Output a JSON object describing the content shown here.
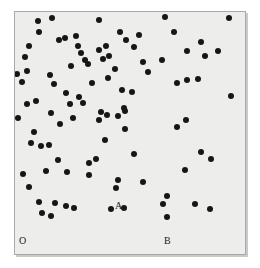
{
  "figure": {
    "type": "scatter",
    "title": "",
    "background_color": "#ffffff",
    "plot_background_color": "#ededeb",
    "border_color": "#a9a9a9",
    "point_color": "#161616",
    "label_color": "#1a1a1a",
    "point_diameter_px": 6,
    "frame": {
      "left": 14,
      "top": 11,
      "width": 232,
      "height": 244
    }
  },
  "labels": {
    "origin": "O",
    "origin_pos": {
      "x": 4,
      "y": 224
    },
    "point_labels": [
      {
        "text": "A",
        "x": 100,
        "y": 189
      },
      {
        "text": "B",
        "x": 149,
        "y": 224
      }
    ]
  },
  "chart_data": {
    "type": "scatter",
    "title": "",
    "xlabel": "",
    "ylabel": "",
    "xlim": [
      0,
      232
    ],
    "ylim": [
      0,
      244
    ],
    "grid": false,
    "legend": null,
    "annotations": [
      {
        "label": "O",
        "x": 4,
        "y": 229,
        "role": "origin-marker"
      },
      {
        "label": "A",
        "x": 104,
        "y": 194,
        "role": "named-point"
      },
      {
        "label": "B",
        "x": 152,
        "y": 229,
        "role": "named-point"
      }
    ],
    "point_count": 96,
    "points": [
      [
        23,
        9
      ],
      [
        37,
        6
      ],
      [
        84,
        8
      ],
      [
        150,
        5
      ],
      [
        214,
        6
      ],
      [
        24,
        20
      ],
      [
        50,
        26
      ],
      [
        61,
        24
      ],
      [
        105,
        20
      ],
      [
        124,
        23
      ],
      [
        159,
        20
      ],
      [
        186,
        30
      ],
      [
        14,
        34
      ],
      [
        44,
        28
      ],
      [
        63,
        34
      ],
      [
        84,
        38
      ],
      [
        91,
        34
      ],
      [
        111,
        28
      ],
      [
        119,
        35
      ],
      [
        10,
        45
      ],
      [
        66,
        41
      ],
      [
        70,
        48
      ],
      [
        94,
        44
      ],
      [
        172,
        39
      ],
      [
        190,
        44
      ],
      [
        2,
        62
      ],
      [
        7,
        70
      ],
      [
        12,
        59
      ],
      [
        56,
        54
      ],
      [
        73,
        52
      ],
      [
        88,
        47
      ],
      [
        100,
        57
      ],
      [
        128,
        50
      ],
      [
        133,
        60
      ],
      [
        147,
        48
      ],
      [
        203,
        39
      ],
      [
        216,
        84
      ],
      [
        35,
        63
      ],
      [
        39,
        72
      ],
      [
        77,
        71
      ],
      [
        93,
        66
      ],
      [
        162,
        71
      ],
      [
        172,
        68
      ],
      [
        183,
        67
      ],
      [
        51,
        81
      ],
      [
        64,
        85
      ],
      [
        107,
        78
      ],
      [
        117,
        80
      ],
      [
        12,
        92
      ],
      [
        21,
        89
      ],
      [
        55,
        92
      ],
      [
        68,
        91
      ],
      [
        86,
        100
      ],
      [
        110,
        99
      ],
      [
        3,
        106
      ],
      [
        36,
        101
      ],
      [
        45,
        112
      ],
      [
        58,
        106
      ],
      [
        84,
        108
      ],
      [
        92,
        103
      ],
      [
        103,
        104
      ],
      [
        109,
        96
      ],
      [
        19,
        120
      ],
      [
        110,
        117
      ],
      [
        162,
        115
      ],
      [
        171,
        108
      ],
      [
        16,
        131
      ],
      [
        26,
        134
      ],
      [
        34,
        133
      ],
      [
        186,
        140
      ],
      [
        196,
        147
      ],
      [
        74,
        151
      ],
      [
        81,
        147
      ],
      [
        31,
        159
      ],
      [
        8,
        162
      ],
      [
        52,
        160
      ],
      [
        74,
        163
      ],
      [
        170,
        158
      ],
      [
        103,
        168
      ],
      [
        101,
        176
      ],
      [
        14,
        175
      ],
      [
        40,
        191
      ],
      [
        51,
        194
      ],
      [
        59,
        196
      ],
      [
        148,
        192
      ],
      [
        152,
        184
      ],
      [
        180,
        192
      ],
      [
        24,
        190
      ],
      [
        27,
        201
      ],
      [
        36,
        204
      ],
      [
        96,
        197
      ],
      [
        109,
        196
      ],
      [
        152,
        205
      ],
      [
        195,
        197
      ],
      [
        128,
        170
      ],
      [
        119,
        142
      ],
      [
        90,
        128
      ],
      [
        43,
        148
      ]
    ]
  }
}
